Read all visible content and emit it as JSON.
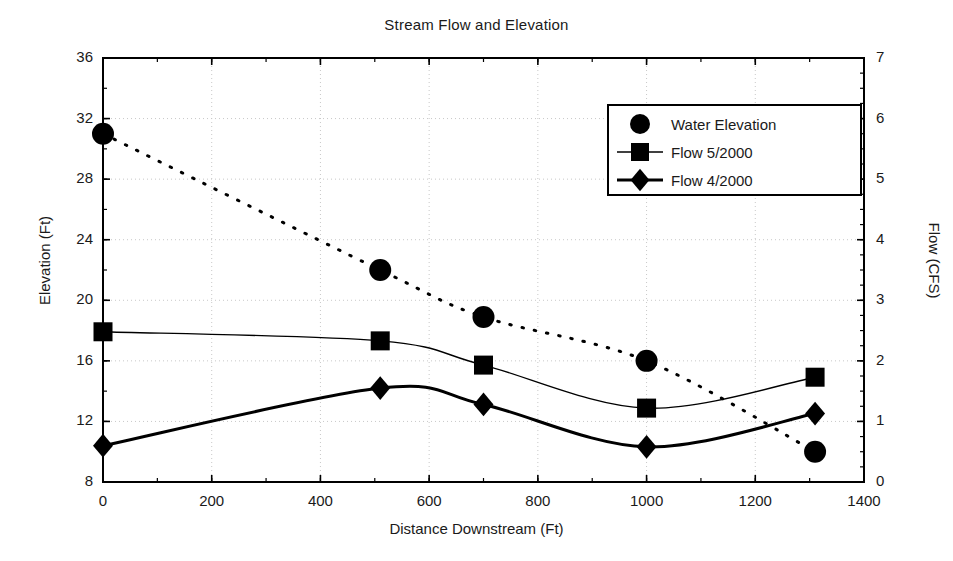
{
  "chart_data": {
    "type": "scatter",
    "title": "Stream Flow and Elevation",
    "xlabel": "Distance Downstream (Ft)",
    "ylabel": "Elevation (Ft)",
    "y2label": "Flow (CFS)",
    "xlim": [
      0,
      1400
    ],
    "ylim": [
      8,
      36
    ],
    "y2lim": [
      0,
      7
    ],
    "xticks": [
      0,
      200,
      400,
      600,
      800,
      1000,
      1200,
      1400
    ],
    "yticks": [
      8,
      12,
      16,
      20,
      24,
      28,
      32,
      36
    ],
    "y2ticks": [
      0,
      1,
      2,
      3,
      4,
      5,
      6,
      7
    ],
    "grid": true,
    "legend_position": "upper right",
    "series": [
      {
        "name": "Water Elevation",
        "axis": "left",
        "marker": "circle",
        "line_style": "dotted",
        "line_width": 1,
        "x": [
          0,
          510,
          700,
          1000,
          1310
        ],
        "values": [
          31.0,
          22.0,
          18.9,
          16.0,
          10.0
        ]
      },
      {
        "name": "Flow 5/2000",
        "axis": "right",
        "marker": "square",
        "line_style": "solid",
        "line_width": 1.4,
        "x": [
          0,
          510,
          700,
          1000,
          1310
        ],
        "values": [
          2.48,
          2.33,
          1.93,
          1.22,
          1.73
        ]
      },
      {
        "name": "Flow 4/2000",
        "axis": "right",
        "marker": "diamond",
        "line_style": "solid",
        "line_width": 3,
        "x": [
          0,
          510,
          700,
          1000,
          1310
        ],
        "values": [
          0.6,
          1.55,
          1.28,
          0.58,
          1.13
        ]
      }
    ],
    "colors": {
      "ink": "#000000",
      "grid": "#c8c8c8",
      "background": "#ffffff"
    }
  }
}
